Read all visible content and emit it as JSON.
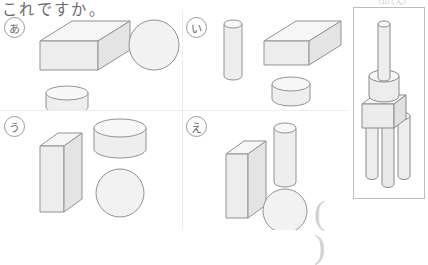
{
  "worksheet": {
    "prompt_text": "これですか。",
    "points_note": "（10てん）",
    "answer_blank": "( )"
  },
  "choices": [
    {
      "id": "a",
      "label": "あ",
      "name": "choice-a",
      "shapes": [
        "flat-rectangular-prism",
        "sphere",
        "short-cylinder"
      ]
    },
    {
      "id": "i",
      "label": "い",
      "name": "choice-i",
      "shapes": [
        "tall-thin-cylinder",
        "flat-rectangular-prism",
        "short-cylinder"
      ]
    },
    {
      "id": "u",
      "label": "う",
      "name": "choice-u",
      "shapes": [
        "tall-rectangular-prism",
        "wide-cylinder",
        "sphere"
      ]
    },
    {
      "id": "e",
      "label": "え",
      "name": "choice-e",
      "shapes": [
        "tall-rectangular-prism",
        "tall-cylinder",
        "sphere"
      ]
    }
  ],
  "figure": {
    "name": "assembled-solid-figure",
    "parts": [
      "thin-rod",
      "cylinder",
      "box",
      "three-legs"
    ]
  },
  "colors": {
    "outline": "#8a8a8a",
    "fill_light": "#f4f4f4",
    "fill_mid": "#ebebeb",
    "fill_dark": "#e0e0e0",
    "ink": "#6b6b6b",
    "border": "#bdbdbd"
  }
}
